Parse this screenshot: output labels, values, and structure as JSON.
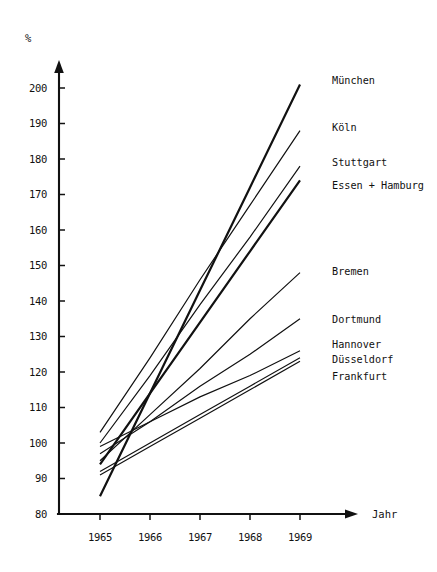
{
  "chart_data": {
    "type": "line",
    "title": "",
    "xlabel": "Jahr",
    "ylabel": "%",
    "x": [
      1965,
      1966,
      1967,
      1968,
      1969
    ],
    "xtick_labels": [
      "1965",
      "1966",
      "1967",
      "1968",
      "1969"
    ],
    "ytick_labels": [
      "80",
      "90",
      "100",
      "110",
      "120",
      "130",
      "140",
      "150",
      "160",
      "170",
      "180",
      "190",
      "200"
    ],
    "yticks": [
      80,
      90,
      100,
      110,
      120,
      130,
      140,
      150,
      160,
      170,
      180,
      190,
      200
    ],
    "ylim": [
      80,
      205
    ],
    "xlim": [
      1964.55,
      1969.6
    ],
    "grid": false,
    "legend_position": "right-inline",
    "series": [
      {
        "name": "München",
        "label": "München",
        "values": [
          85,
          114,
          143,
          172,
          201
        ],
        "width": 2.2
      },
      {
        "name": "Köln",
        "label": "Köln",
        "values": [
          103,
          124,
          146,
          167,
          188
        ],
        "width": 1.2
      },
      {
        "name": "Stuttgart",
        "label": "Stuttgart",
        "values": [
          100,
          119,
          139,
          158,
          178
        ],
        "width": 1.2
      },
      {
        "name": "Essen + Hamburg",
        "label": "Essen + Hamburg",
        "values": [
          94,
          114,
          134,
          154,
          174
        ],
        "width": 2.2
      },
      {
        "name": "Bremen",
        "label": "Bremen",
        "values": [
          95,
          108,
          121,
          135,
          148
        ],
        "width": 1.2
      },
      {
        "name": "Dortmund",
        "label": "Dortmund",
        "values": [
          97,
          106,
          116,
          125,
          135
        ],
        "width": 1.2
      },
      {
        "name": "Hannover",
        "label": "Hannover",
        "values": [
          99,
          106,
          113,
          119,
          126
        ],
        "width": 1.2
      },
      {
        "name": "Düsseldorf",
        "label": "Düsseldorf",
        "values": [
          92,
          100,
          108,
          116,
          124
        ],
        "width": 1.2
      },
      {
        "name": "Frankfurt",
        "label": "Frankfurt",
        "values": [
          91,
          99,
          107,
          115,
          123
        ],
        "width": 1.2
      }
    ],
    "label_positions": [
      {
        "name": "München",
        "x": 332,
        "y": 84
      },
      {
        "name": "Köln",
        "x": 332,
        "y": 131
      },
      {
        "name": "Stuttgart",
        "x": 332,
        "y": 166
      },
      {
        "name": "Essen + Hamburg",
        "x": 332,
        "y": 189
      },
      {
        "name": "Bremen",
        "x": 332,
        "y": 275
      },
      {
        "name": "Dortmund",
        "x": 332,
        "y": 323
      },
      {
        "name": "Hannover",
        "x": 332,
        "y": 348
      },
      {
        "name": "Düsseldorf",
        "x": 332,
        "y": 363
      },
      {
        "name": "Frankfurt",
        "x": 332,
        "y": 380
      }
    ],
    "colors": {
      "line": "#111111",
      "axis": "#111111",
      "background": "#ffffff"
    }
  }
}
